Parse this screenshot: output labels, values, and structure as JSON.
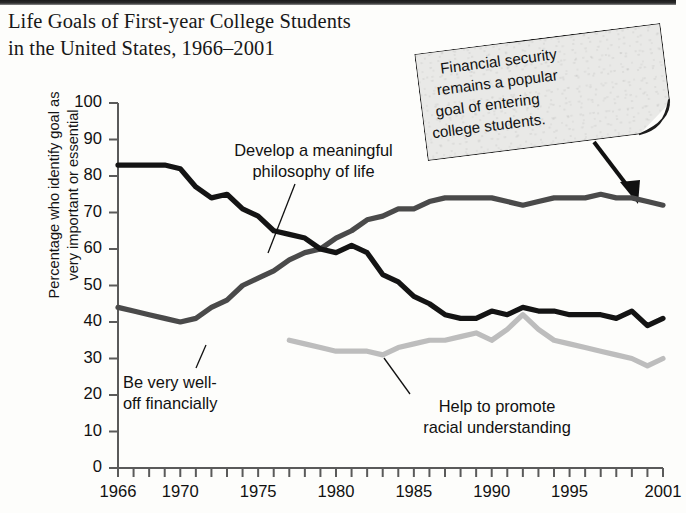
{
  "title": {
    "line1": "Life Goals of First-year College Students",
    "line2": "in the United States, 1966–2001"
  },
  "callout": {
    "lines": [
      "Financial security",
      "remains a popular",
      "goal of entering",
      "college students."
    ],
    "full_text": "Financial security remains a popular goal of entering college students.",
    "paper_color": "#e9e9e7",
    "border_color": "#1c1c1c"
  },
  "chart_data": {
    "type": "line",
    "title": "Life Goals of First-year College Students in the United States, 1966–2001",
    "xlabel": "",
    "ylabel": "Percentage who identify goal as very important or essential",
    "ylabel_lines": [
      "Percentage who identify goal as",
      "very important or essential"
    ],
    "ylim": [
      0,
      100
    ],
    "ytick_step": 10,
    "yticks": [
      0,
      10,
      20,
      30,
      40,
      50,
      60,
      70,
      80,
      90,
      100
    ],
    "xlim": [
      1966,
      2001
    ],
    "xticks_all_years": true,
    "xtick_labels": [
      1966,
      1970,
      1975,
      1980,
      1985,
      1990,
      1995,
      2001
    ],
    "grid": false,
    "legend_position": "inline-annotations",
    "series": [
      {
        "name": "Develop a meaningful philosophy of life",
        "label_lines": [
          "Develop a meaningful",
          "philosophy of life"
        ],
        "color": "#141414",
        "width": 5.2,
        "x": [
          1966,
          1967,
          1968,
          1969,
          1970,
          1971,
          1972,
          1973,
          1974,
          1975,
          1976,
          1977,
          1978,
          1979,
          1980,
          1981,
          1982,
          1983,
          1984,
          1985,
          1986,
          1987,
          1988,
          1989,
          1990,
          1991,
          1992,
          1993,
          1994,
          1995,
          1996,
          1997,
          1998,
          1999,
          2000,
          2001
        ],
        "y": [
          83,
          83,
          83,
          83,
          82,
          77,
          74,
          75,
          71,
          69,
          65,
          64,
          63,
          60,
          59,
          61,
          59,
          53,
          51,
          47,
          45,
          42,
          41,
          41,
          43,
          42,
          44,
          43,
          43,
          42,
          42,
          42,
          41,
          43,
          39,
          41
        ]
      },
      {
        "name": "Be very well-off financially",
        "label_lines": [
          "Be very well-",
          "off financially"
        ],
        "color": "#4a4a4a",
        "width": 5.2,
        "x": [
          1966,
          1967,
          1968,
          1969,
          1970,
          1971,
          1972,
          1973,
          1974,
          1975,
          1976,
          1977,
          1978,
          1979,
          1980,
          1981,
          1982,
          1983,
          1984,
          1985,
          1986,
          1987,
          1988,
          1989,
          1990,
          1991,
          1992,
          1993,
          1994,
          1995,
          1996,
          1997,
          1998,
          1999,
          2000,
          2001
        ],
        "y": [
          44,
          43,
          42,
          41,
          40,
          41,
          44,
          46,
          50,
          52,
          54,
          57,
          59,
          60,
          63,
          65,
          68,
          69,
          71,
          71,
          73,
          74,
          74,
          74,
          74,
          73,
          72,
          73,
          74,
          74,
          74,
          75,
          74,
          74,
          73,
          72
        ]
      },
      {
        "name": "Help to promote racial understanding",
        "label_lines": [
          "Help to promote",
          "racial understanding"
        ],
        "color": "#bdbdbd",
        "width": 5.2,
        "x": [
          1977,
          1978,
          1979,
          1980,
          1981,
          1982,
          1983,
          1984,
          1985,
          1986,
          1987,
          1988,
          1989,
          1990,
          1991,
          1992,
          1993,
          1994,
          1995,
          1996,
          1997,
          1998,
          1999,
          2000,
          2001
        ],
        "y": [
          35,
          34,
          33,
          32,
          32,
          32,
          31,
          33,
          34,
          35,
          35,
          36,
          37,
          35,
          38,
          42,
          38,
          35,
          34,
          33,
          32,
          31,
          30,
          28,
          30
        ]
      }
    ]
  }
}
